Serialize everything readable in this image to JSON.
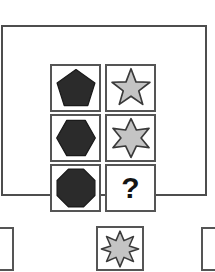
{
  "puzzle": {
    "type": "matrix-reasoning",
    "title": "Shape Progression Matrix",
    "rows": 3,
    "columns": 2,
    "missing_cell": {
      "row": 3,
      "column": 2,
      "label": "?"
    }
  },
  "colors": {
    "polygon_fill": "#2b2b2b",
    "polygon_stroke": "#1a1a1a",
    "star_fill": "#c4c4c4",
    "star_stroke": "#3a3a3a",
    "cell_border": "#555555",
    "frame_border": "#4d4d4d",
    "background": "#ffffff",
    "question_mark": "#141414"
  },
  "matrix": {
    "cells": [
      {
        "id": "cell-r1c1",
        "row": 1,
        "column": 1,
        "shape": "pentagon",
        "shape_label": "pentagon",
        "sides": 5,
        "fill": "#2b2b2b",
        "stroke": "#1a1a1a",
        "kind": "polygon"
      },
      {
        "id": "cell-r1c2",
        "row": 1,
        "column": 2,
        "shape": "star-5",
        "shape_label": "five-pointed star",
        "points": 5,
        "fill": "#c4c4c4",
        "stroke": "#3a3a3a",
        "kind": "star"
      },
      {
        "id": "cell-r2c1",
        "row": 2,
        "column": 1,
        "shape": "hexagon",
        "shape_label": "hexagon",
        "sides": 6,
        "fill": "#2b2b2b",
        "stroke": "#1a1a1a",
        "kind": "polygon"
      },
      {
        "id": "cell-r2c2",
        "row": 2,
        "column": 2,
        "shape": "star-6",
        "shape_label": "six-pointed star",
        "points": 6,
        "fill": "#c4c4c4",
        "stroke": "#3a3a3a",
        "kind": "star"
      },
      {
        "id": "cell-r3c1",
        "row": 3,
        "column": 1,
        "shape": "octagon",
        "shape_label": "octagon",
        "sides": 8,
        "fill": "#2b2b2b",
        "stroke": "#1a1a1a",
        "kind": "polygon"
      },
      {
        "id": "cell-r3c2",
        "row": 3,
        "column": 2,
        "shape": "question-mark",
        "shape_label": "unknown",
        "kind": "placeholder",
        "text": "?"
      }
    ]
  },
  "options": {
    "visible_count": 3,
    "items": [
      {
        "id": "option-left",
        "position": "left",
        "cropped": true,
        "shape": "none",
        "shape_label": "clipped option box"
      },
      {
        "id": "option-center",
        "position": "center",
        "cropped": false,
        "shape": "star-8",
        "shape_label": "eight-pointed star",
        "points": 8,
        "fill": "#c4c4c4",
        "stroke": "#3a3a3a"
      },
      {
        "id": "option-right",
        "position": "right",
        "cropped": true,
        "shape": "none",
        "shape_label": "clipped option box"
      }
    ]
  }
}
